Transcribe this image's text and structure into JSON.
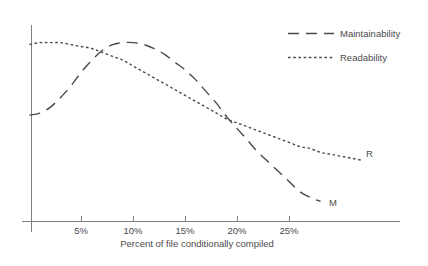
{
  "chart_data": {
    "type": "line",
    "title": "",
    "xlabel": "Percent of file conditionally compiled",
    "ylabel": "",
    "xlim": [
      0,
      30
    ],
    "ylim": [
      0,
      100
    ],
    "grid": false,
    "legend_position": "top-right",
    "xticks": [
      "5%",
      "10%",
      "15%",
      "20%",
      "25%"
    ],
    "xtick_values": [
      5,
      10,
      15,
      20,
      25
    ],
    "yticks": [],
    "series": [
      {
        "name": "Maintainability",
        "style": "dashed",
        "end_label": "M",
        "x": [
          0,
          1,
          2,
          3,
          4,
          5,
          6,
          7,
          8,
          9,
          10,
          11,
          12,
          13,
          14,
          15,
          16,
          17,
          18,
          19,
          20,
          21,
          22,
          23,
          24,
          25,
          26,
          27,
          28
        ],
        "y": [
          54,
          55,
          58,
          63,
          69,
          76,
          82,
          87,
          90,
          91,
          91,
          90,
          88,
          85,
          81,
          77,
          72,
          66,
          60,
          53,
          47,
          41,
          35,
          30,
          25,
          20,
          15,
          12,
          10
        ]
      },
      {
        "name": "Readability",
        "style": "dotted",
        "end_label": "R",
        "x": [
          0,
          1,
          2,
          3,
          4,
          5,
          6,
          7,
          8,
          9,
          10,
          11,
          12,
          13,
          14,
          15,
          16,
          17,
          18,
          19,
          20,
          21,
          22,
          23,
          24,
          25,
          26,
          27,
          28,
          29,
          30,
          31,
          32
        ],
        "y": [
          90,
          91,
          91,
          91,
          90,
          89,
          88,
          86,
          84,
          82,
          79,
          76,
          73,
          70,
          67,
          64,
          61,
          58,
          55,
          52,
          50,
          48,
          46,
          44,
          42,
          40,
          38,
          37,
          35,
          34,
          33,
          32,
          31
        ]
      }
    ],
    "annotations": [
      {
        "text": "M",
        "series": "Maintainability"
      },
      {
        "text": "R",
        "series": "Readability"
      }
    ]
  },
  "legend": {
    "items": [
      {
        "label": "Maintainability",
        "style": "dashed"
      },
      {
        "label": "Readability",
        "style": "dotted"
      }
    ]
  },
  "axis": {
    "x_title": "Percent of file conditionally compiled",
    "tick_labels": [
      "5%",
      "10%",
      "15%",
      "20%",
      "25%"
    ]
  },
  "series_end_labels": {
    "maintainability": "M",
    "readability": "R"
  },
  "colors": {
    "line": "#4a4a4a",
    "axis": "#808080",
    "text": "#4a4a4a",
    "background": "#ffffff"
  }
}
